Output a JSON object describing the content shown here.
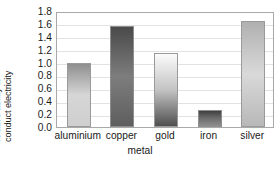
{
  "chart_data": {
    "type": "bar",
    "title": "",
    "xlabel": "metal",
    "ylabel": "relative ability to conduct electricity",
    "ylabel_lines": [
      "relative ability to",
      "conduct electricity"
    ],
    "categories": [
      "aluminium",
      "copper",
      "gold",
      "iron",
      "silver"
    ],
    "values": [
      1.0,
      1.57,
      1.15,
      0.26,
      1.65
    ],
    "ylim": [
      0.0,
      1.8
    ],
    "ytick_values": [
      0.0,
      0.2,
      0.4,
      0.6,
      0.8,
      1.0,
      1.2,
      1.4,
      1.6,
      1.8
    ],
    "ytick_labels": [
      "0.0",
      "0.2",
      "0.4",
      "0.6",
      "0.8",
      "1.0",
      "1.2",
      "1.4",
      "1.6",
      "1.8"
    ],
    "grid": true,
    "grid_axis": "y",
    "legend": false,
    "legend_position": "none",
    "bar_styles": [
      {
        "name": "aluminium",
        "gradient_top": "#8f8f8f",
        "gradient_mid": "#d6d6d6",
        "gradient_bottom": "#cfcfcf",
        "border": "#9a9a9a"
      },
      {
        "name": "copper",
        "gradient_top": "#4a4a4a",
        "gradient_mid": "#7d7d7d",
        "gradient_bottom": "#5e5e5e",
        "border": "#8e8e8e"
      },
      {
        "name": "gold",
        "gradient_top": "#fbfbfb",
        "gradient_mid": "#c3c3c3",
        "gradient_bottom": "#4f4f4f",
        "border": "#9a9a9a"
      },
      {
        "name": "iron",
        "gradient_top": "#3f3f3f",
        "gradient_mid": "#6e6e6e",
        "gradient_bottom": "#8e8e8e",
        "border": "#8e8e8e"
      },
      {
        "name": "silver",
        "gradient_top": "#b0b0b0",
        "gradient_mid": "#d9d9d9",
        "gradient_bottom": "#b8b8b8",
        "border": "#9a9a9a"
      }
    ],
    "frame_color": "#a9a9a9",
    "gridline_color": "#e2e2e2",
    "background": "#ffffff"
  }
}
